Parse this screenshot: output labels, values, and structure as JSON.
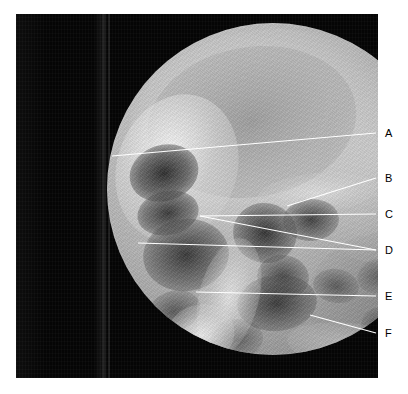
{
  "figure": {
    "type": "radiograph",
    "modality": "x-ray",
    "view": "lateral skull / paranasal sinus radiograph",
    "field_shape": "circular",
    "background_color": "#050505",
    "label_color": "#000000",
    "leader_line_color": "#ffffff",
    "canvas": {
      "width": 408,
      "height": 394
    }
  },
  "plate": {
    "name": "radiograph-plate",
    "x": 16,
    "y": 14,
    "width": 362,
    "height": 364
  },
  "field": {
    "name": "circular-fluoroscopic-field",
    "center_x": 237,
    "center_y": 189,
    "radius": 166
  },
  "labels": [
    {
      "id": "A",
      "text": "A",
      "x": 385,
      "y": 128,
      "leader": {
        "x1": 112,
        "y1": 156,
        "x2": 376,
        "y2": 133
      }
    },
    {
      "id": "B",
      "text": "B",
      "x": 385,
      "y": 173,
      "leader": {
        "x1": 287,
        "y1": 206,
        "x2": 376,
        "y2": 178
      }
    },
    {
      "id": "C",
      "text": "C",
      "x": 385,
      "y": 209,
      "leader": {
        "x1": 200,
        "y1": 216,
        "x2": 376,
        "y2": 214
      }
    },
    {
      "id": "D",
      "text": "D",
      "x": 385,
      "y": 245,
      "leader": {
        "x1": 138,
        "y1": 243,
        "x2": 376,
        "y2": 250
      }
    },
    {
      "id": "D2",
      "text": "",
      "x": 0,
      "y": 0,
      "leader": {
        "x1": 200,
        "y1": 216,
        "x2": 376,
        "y2": 250
      }
    },
    {
      "id": "E",
      "text": "E",
      "x": 385,
      "y": 291,
      "leader": {
        "x1": 196,
        "y1": 292,
        "x2": 376,
        "y2": 296
      }
    },
    {
      "id": "F",
      "text": "F",
      "x": 385,
      "y": 328,
      "leader": {
        "x1": 310,
        "y1": 315,
        "x2": 376,
        "y2": 333
      }
    }
  ],
  "label_order": [
    "A",
    "B",
    "C",
    "D",
    "E",
    "F"
  ]
}
